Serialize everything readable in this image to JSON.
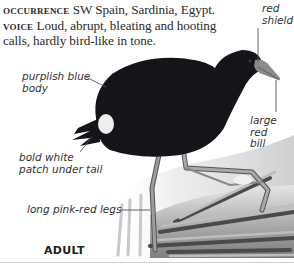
{
  "entry": {
    "occurrence": {
      "heading": "OCCURRENCE",
      "text": "SW Spain, Sardinia, Egypt."
    },
    "voice": {
      "heading": "VOICE",
      "text": "Loud, abrupt, bleating and hooting calls, hardly bird-like in tone."
    }
  },
  "annotations": {
    "red_shield": [
      "red",
      "shield"
    ],
    "purplish_blue_body": [
      "purplish blue",
      "body"
    ],
    "large_red_bill": [
      "large",
      "red",
      "bill"
    ],
    "bold_white_patch": [
      "bold white",
      "patch under tail"
    ],
    "long_legs": "long pink-red legs"
  },
  "caption": "ADULT",
  "colors": {
    "plumage": "#141419",
    "undertail_patch": "#eeeeee",
    "bill": "#8a8a8a",
    "reeds": "#9a9a9a",
    "text": "#2a2a2a"
  }
}
